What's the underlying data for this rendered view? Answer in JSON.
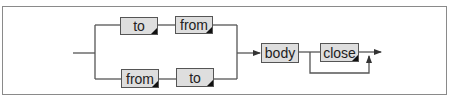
{
  "diagram": {
    "type": "railroad-syntax-diagram",
    "nodes": [
      {
        "id": "top-to",
        "label": "to",
        "branch": "upper",
        "keyword": true
      },
      {
        "id": "top-from",
        "label": "from",
        "branch": "upper",
        "keyword": true
      },
      {
        "id": "bottom-from",
        "label": "from",
        "branch": "lower",
        "keyword": true
      },
      {
        "id": "bottom-to",
        "label": "to",
        "branch": "lower",
        "keyword": true
      },
      {
        "id": "body",
        "label": "body",
        "keyword": false
      },
      {
        "id": "close",
        "label": "close",
        "keyword": true,
        "optional": true
      }
    ],
    "paths": [
      "entry -> split",
      "split -> to -> from -> merge",
      "split -> from -> to -> merge",
      "merge -> body",
      "body -> close -> exit",
      "body -> bypass(close) -> exit"
    ]
  },
  "colors": {
    "box_fill": "#dedede",
    "box_border": "#555555",
    "line": "#555555",
    "frame": "#8a8a8a",
    "corner_marker": "#111111"
  }
}
